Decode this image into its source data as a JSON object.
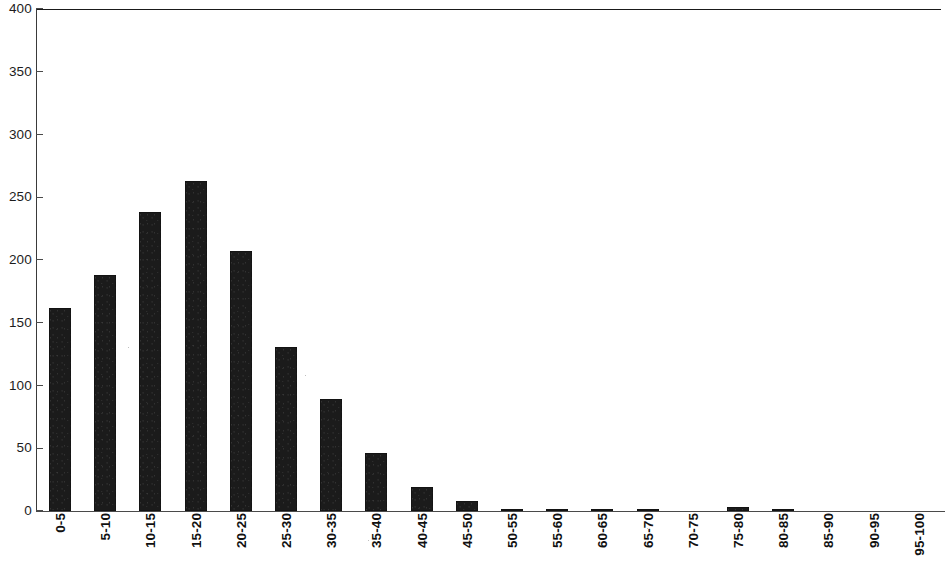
{
  "chart_data": {
    "type": "bar",
    "title": "",
    "subtitle": "",
    "xlabel": "",
    "ylabel": "",
    "ylim": [
      0,
      400
    ],
    "yticks": [
      0,
      50,
      100,
      150,
      200,
      250,
      300,
      350,
      400
    ],
    "ytick_labels": [
      "0",
      "50",
      "100",
      "150",
      "200",
      "250",
      "300",
      "350",
      "400"
    ],
    "grid": false,
    "legend": null,
    "bar_color": "#1b1b1b",
    "categories": [
      "0-5",
      "5-10",
      "10-15",
      "15-20",
      "20-25",
      "25-30",
      "30-35",
      "35-40",
      "40-45",
      "45-50",
      "50-55",
      "55-60",
      "60-65",
      "65-70",
      "70-75",
      "75-80",
      "80-85",
      "85-90",
      "90-95",
      "95-100"
    ],
    "values": [
      162,
      188,
      238,
      263,
      207,
      131,
      89,
      46,
      19,
      8,
      1,
      1,
      1,
      1,
      0,
      3,
      1,
      0,
      0,
      0
    ],
    "annotations": []
  },
  "axes": {
    "y_axis_name": "frequency-axis",
    "x_axis_name": "bin-axis"
  }
}
